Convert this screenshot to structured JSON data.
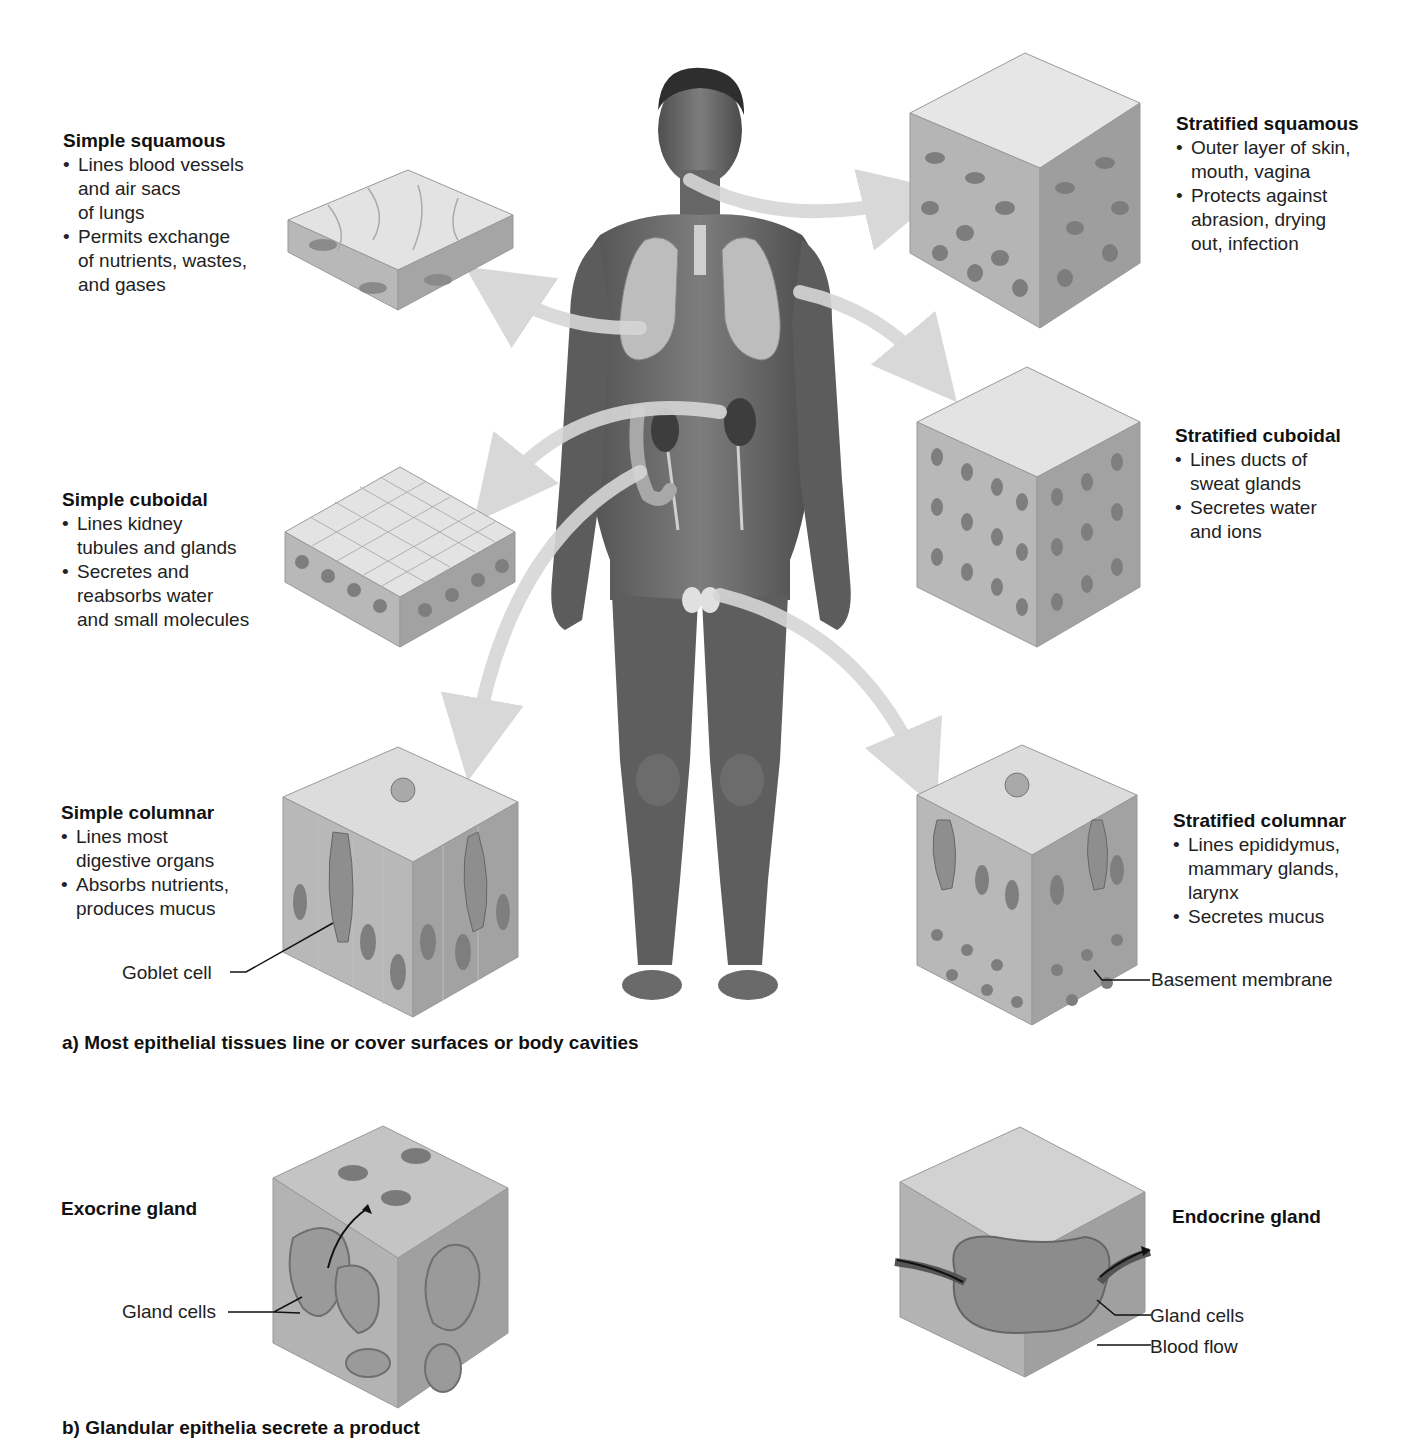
{
  "figure": {
    "part_a_caption": "a) Most epithelial tissues line or cover surfaces or body cavities",
    "part_b_caption": "b) Glandular epithelia secrete a product"
  },
  "tissues": {
    "simple_squamous": {
      "title": "Simple squamous",
      "bullets": [
        [
          "Lines blood vessels",
          "and air sacs",
          "of lungs"
        ],
        [
          "Permits exchange",
          "of nutrients, wastes,",
          "and gases"
        ]
      ]
    },
    "stratified_squamous": {
      "title": "Stratified squamous",
      "bullets": [
        [
          "Outer layer of skin,",
          "mouth, vagina"
        ],
        [
          "Protects against",
          "abrasion, drying",
          "out, infection"
        ]
      ]
    },
    "simple_cuboidal": {
      "title": "Simple cuboidal",
      "bullets": [
        [
          "Lines kidney",
          "tubules and glands"
        ],
        [
          "Secretes and",
          "reabsorbs water",
          "and small molecules"
        ]
      ]
    },
    "stratified_cuboidal": {
      "title": "Stratified cuboidal",
      "bullets": [
        [
          "Lines ducts of",
          "sweat glands"
        ],
        [
          "Secretes water",
          "and ions"
        ]
      ]
    },
    "simple_columnar": {
      "title": "Simple columnar",
      "bullets": [
        [
          "Lines most",
          "digestive organs"
        ],
        [
          "Absorbs nutrients,",
          "produces mucus"
        ]
      ],
      "callout": "Goblet  cell"
    },
    "stratified_columnar": {
      "title": "Stratified columnar",
      "bullets": [
        [
          "Lines epididymus,",
          "mammary glands,",
          "larynx"
        ],
        [
          "Secretes mucus"
        ]
      ],
      "callout": "Basement membrane"
    }
  },
  "glands": {
    "exocrine": {
      "title": "Exocrine gland",
      "callout": "Gland cells"
    },
    "endocrine": {
      "title": "Endocrine gland",
      "callouts": [
        "Gland cells",
        "Blood flow"
      ]
    }
  },
  "colors": {
    "tissue_light": "#d9d9d9",
    "tissue_mid": "#b3b3b3",
    "tissue_dark": "#8c8c8c",
    "nucleus": "#7a7a7a",
    "body_skin": "#6e6e6e",
    "arrow": "#d6d6d6"
  }
}
